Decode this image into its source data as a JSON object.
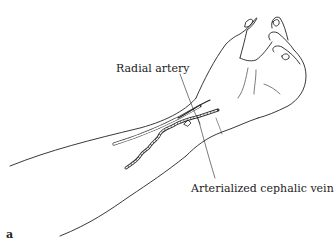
{
  "figure": {
    "panel_label": "a",
    "labels": {
      "radial_artery": "Radial artery",
      "arterialized_cephalic_vein": "Arterialized cephalic vein"
    },
    "colors": {
      "line": "#222222",
      "background": "#ffffff"
    }
  }
}
